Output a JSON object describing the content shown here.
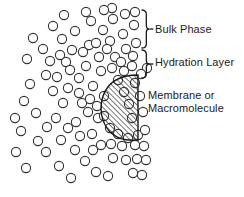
{
  "figure": {
    "background_color": "#ffffff",
    "stroke_color": "#333333",
    "text_color": "#1a1a1a"
  },
  "labels": {
    "bulk_phase": "Bulk Phase",
    "hydration_layer": "Hydration Layer",
    "membrane_line1": "Membrane or",
    "membrane_line2": "Macromolecule"
  },
  "braces": [
    {
      "name": "bulk-phase-brace",
      "x": 142,
      "y_top": 10,
      "y_bottom": 48
    },
    {
      "name": "hydration-layer-brace",
      "x": 142,
      "y_top": 50,
      "y_bottom": 78
    }
  ],
  "membrane_shape": {
    "name": "membrane-macromolecule",
    "fill": "hatched",
    "hatch_angle_deg": 45,
    "hatch_spacing_px": 2.6,
    "bounds": {
      "x": 102,
      "y": 74,
      "width": 37,
      "height": 67
    }
  },
  "water_molecules": {
    "description": "open circles representing water molecules",
    "radius_px": 4.6,
    "count": 96,
    "positions": [
      [
        43,
        49
      ],
      [
        46,
        75
      ],
      [
        53,
        26
      ],
      [
        53,
        91
      ],
      [
        36,
        113
      ],
      [
        47,
        127
      ],
      [
        46,
        152
      ],
      [
        62,
        39
      ],
      [
        66,
        62
      ],
      [
        63,
        103
      ],
      [
        61,
        140
      ],
      [
        59,
        166
      ],
      [
        82,
        103
      ],
      [
        75,
        31
      ],
      [
        72,
        50
      ],
      [
        79,
        78
      ],
      [
        76,
        122
      ],
      [
        75,
        150
      ],
      [
        71,
        178
      ],
      [
        91,
        21
      ],
      [
        89,
        45
      ],
      [
        86,
        66
      ],
      [
        93,
        86
      ],
      [
        88,
        112
      ],
      [
        92,
        134
      ],
      [
        85,
        161
      ],
      [
        103,
        30
      ],
      [
        99,
        57
      ],
      [
        101,
        71
      ],
      [
        104,
        96
      ],
      [
        98,
        118
      ],
      [
        101,
        145
      ],
      [
        96,
        172
      ],
      [
        113,
        19
      ],
      [
        110,
        41
      ],
      [
        115,
        57
      ],
      [
        112,
        68
      ],
      [
        111,
        144
      ],
      [
        113,
        158
      ],
      [
        108,
        176
      ],
      [
        123,
        34
      ],
      [
        126,
        49
      ],
      [
        121,
        62
      ],
      [
        124,
        71
      ],
      [
        122,
        146
      ],
      [
        126,
        160
      ],
      [
        134,
        25
      ],
      [
        136,
        43
      ],
      [
        133,
        56
      ],
      [
        132,
        66
      ],
      [
        135,
        145
      ],
      [
        137,
        159
      ],
      [
        133,
        173
      ],
      [
        27,
        59
      ],
      [
        30,
        84
      ],
      [
        24,
        101
      ],
      [
        21,
        131
      ],
      [
        16,
        152
      ],
      [
        144,
        146
      ],
      [
        146,
        160
      ],
      [
        142,
        175
      ],
      [
        64,
        15
      ],
      [
        86,
        12
      ],
      [
        112,
        8
      ],
      [
        135,
        12
      ],
      [
        104,
        10
      ],
      [
        125,
        14
      ],
      [
        56,
        118
      ],
      [
        68,
        128
      ],
      [
        80,
        136
      ],
      [
        93,
        150
      ],
      [
        50,
        61
      ],
      [
        57,
        77
      ],
      [
        68,
        88
      ],
      [
        79,
        93
      ],
      [
        90,
        99
      ],
      [
        97,
        106
      ],
      [
        104,
        116
      ],
      [
        110,
        128
      ],
      [
        118,
        134
      ],
      [
        128,
        138
      ],
      [
        138,
        135
      ],
      [
        145,
        130
      ],
      [
        135,
        83
      ],
      [
        140,
        96
      ],
      [
        143,
        112
      ],
      [
        33,
        38
      ],
      [
        38,
        141
      ],
      [
        26,
        168
      ],
      [
        15,
        118
      ],
      [
        60,
        55
      ],
      [
        70,
        70
      ],
      [
        83,
        52
      ],
      [
        96,
        43
      ],
      [
        107,
        49
      ],
      [
        118,
        80
      ],
      [
        124,
        92
      ],
      [
        129,
        104
      ],
      [
        132,
        118
      ],
      [
        147,
        68
      ],
      [
        141,
        74
      ]
    ]
  }
}
